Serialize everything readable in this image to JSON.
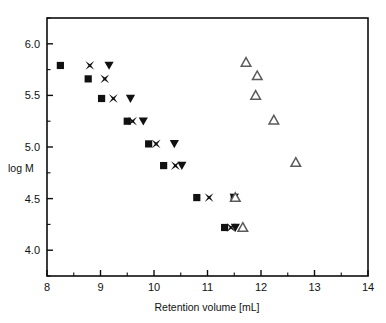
{
  "chart_data": {
    "type": "scatter",
    "title": "",
    "xlabel": "Retention volume [mL]",
    "ylabel": "log M",
    "xlim": [
      8,
      14
    ],
    "ylim": [
      3.75,
      6.25
    ],
    "xticks": [
      8,
      9,
      10,
      11,
      12,
      13,
      14
    ],
    "xticklabels": [
      "8",
      "9",
      "10",
      "11",
      "12",
      "13",
      "14"
    ],
    "xminorticks": [
      8.5,
      9.5,
      10.5,
      11.5,
      12.5,
      13.5
    ],
    "yticks": [
      4.0,
      4.5,
      5.0,
      5.5,
      6.0
    ],
    "yticklabels": [
      "4.0",
      "4.5",
      "5.0",
      "5.5",
      "6.0"
    ],
    "yminorticks": [
      3.75,
      4.25,
      4.75,
      5.25,
      5.75,
      6.25
    ],
    "grid": false,
    "legend": "none",
    "series": [
      {
        "name": "series-squares",
        "marker": "filled-square",
        "color": "#111111",
        "points": [
          {
            "x": 8.25,
            "y": 5.79
          },
          {
            "x": 8.77,
            "y": 5.66
          },
          {
            "x": 9.02,
            "y": 5.47
          },
          {
            "x": 9.5,
            "y": 5.25
          },
          {
            "x": 9.9,
            "y": 5.03
          },
          {
            "x": 10.18,
            "y": 4.82
          },
          {
            "x": 10.8,
            "y": 4.51
          },
          {
            "x": 11.32,
            "y": 4.22
          },
          {
            "x": 11.5,
            "y": 4.51
          }
        ]
      },
      {
        "name": "series-crosses",
        "marker": "x-star",
        "color": "#111111",
        "points": [
          {
            "x": 8.8,
            "y": 5.79
          },
          {
            "x": 9.08,
            "y": 5.66
          },
          {
            "x": 9.24,
            "y": 5.47
          },
          {
            "x": 9.6,
            "y": 5.25
          },
          {
            "x": 10.04,
            "y": 5.03
          },
          {
            "x": 10.4,
            "y": 4.82
          },
          {
            "x": 11.03,
            "y": 4.51
          },
          {
            "x": 11.44,
            "y": 4.22
          },
          {
            "x": 11.5,
            "y": 4.51
          }
        ]
      },
      {
        "name": "series-down-triangles",
        "marker": "filled-triangle-down",
        "color": "#111111",
        "points": [
          {
            "x": 9.16,
            "y": 5.79
          },
          {
            "x": 9.56,
            "y": 5.47
          },
          {
            "x": 9.8,
            "y": 5.25
          },
          {
            "x": 10.38,
            "y": 5.03
          },
          {
            "x": 10.52,
            "y": 4.82
          },
          {
            "x": 11.52,
            "y": 4.22
          },
          {
            "x": 11.5,
            "y": 4.51
          }
        ]
      },
      {
        "name": "series-open-triangles",
        "marker": "open-triangle-up",
        "color": "#5a5a5a",
        "points": [
          {
            "x": 11.72,
            "y": 5.82
          },
          {
            "x": 11.93,
            "y": 5.69
          },
          {
            "x": 11.9,
            "y": 5.5
          },
          {
            "x": 12.24,
            "y": 5.26
          },
          {
            "x": 12.65,
            "y": 4.85
          },
          {
            "x": 11.66,
            "y": 4.22
          },
          {
            "x": 11.52,
            "y": 4.51
          }
        ]
      }
    ]
  }
}
